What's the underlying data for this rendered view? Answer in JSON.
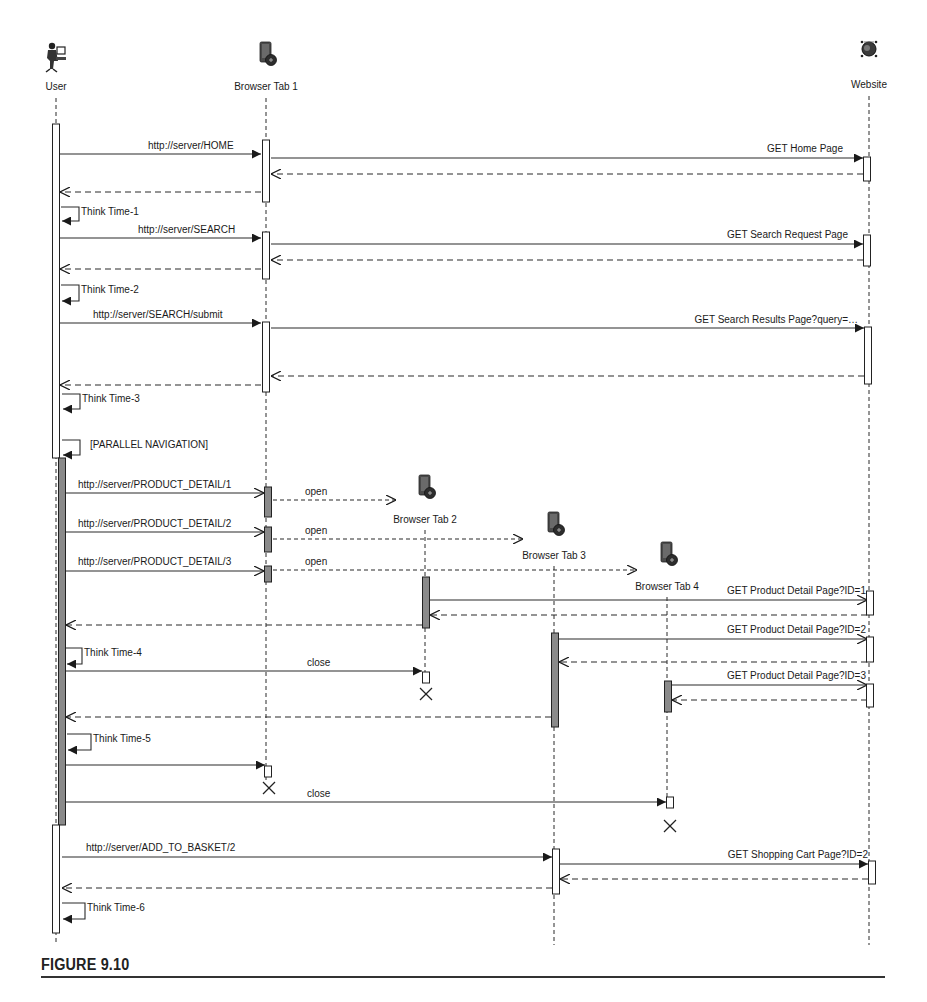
{
  "figure": {
    "caption": "FIGURE 9.10",
    "type": "UML sequence diagram"
  },
  "colors": {
    "line": "#2a2a2a",
    "activation_fill_light": "#ffffff",
    "activation_fill_dark": "#8a8a8a",
    "text": "#1a1a1a"
  },
  "lifelines": [
    {
      "id": "user",
      "label": "User",
      "icon": "user-at-computer-icon",
      "x": 56,
      "head_y": 55,
      "label_y": 90,
      "line_top": 98,
      "line_bottom": 945
    },
    {
      "id": "tab1",
      "label": "Browser Tab 1",
      "icon": "browser-tab-icon",
      "x": 266,
      "head_y": 55,
      "label_y": 90,
      "line_top": 98,
      "line_bottom": 780
    },
    {
      "id": "tab2",
      "label": "Browser Tab 2",
      "icon": "browser-tab-icon",
      "x": 425,
      "head_y": 488,
      "label_y": 523,
      "line_top": 530,
      "line_bottom": 672
    },
    {
      "id": "tab3",
      "label": "Browser Tab 3",
      "icon": "browser-tab-icon",
      "x": 554,
      "head_y": 525,
      "label_y": 559,
      "line_top": 566,
      "line_bottom": 945
    },
    {
      "id": "tab4",
      "label": "Browser Tab 4",
      "icon": "browser-tab-icon",
      "x": 667,
      "head_y": 555,
      "label_y": 590,
      "line_top": 597,
      "line_bottom": 804
    },
    {
      "id": "website",
      "label": "Website",
      "icon": "website-server-icon",
      "x": 869,
      "head_y": 55,
      "label_y": 88,
      "line_top": 96,
      "line_bottom": 945
    }
  ],
  "activations": [
    {
      "lifeline": "user",
      "x": 56,
      "y1": 124,
      "y2": 458,
      "style": "light"
    },
    {
      "lifeline": "user",
      "x": 62,
      "y1": 458,
      "y2": 825,
      "style": "dark"
    },
    {
      "lifeline": "user",
      "x": 56,
      "y1": 825,
      "y2": 933,
      "style": "light"
    },
    {
      "lifeline": "tab1",
      "x": 266,
      "y1": 140,
      "y2": 202,
      "style": "light"
    },
    {
      "lifeline": "tab1",
      "x": 266,
      "y1": 232,
      "y2": 279,
      "style": "light"
    },
    {
      "lifeline": "tab1",
      "x": 266,
      "y1": 322,
      "y2": 392,
      "style": "light"
    },
    {
      "lifeline": "tab1",
      "x": 268,
      "y1": 487,
      "y2": 517,
      "style": "dark"
    },
    {
      "lifeline": "tab1",
      "x": 268,
      "y1": 527,
      "y2": 552,
      "style": "dark"
    },
    {
      "lifeline": "tab1",
      "x": 268,
      "y1": 566,
      "y2": 582,
      "style": "dark"
    },
    {
      "lifeline": "tab1",
      "x": 268,
      "y1": 766,
      "y2": 777,
      "style": "light"
    },
    {
      "lifeline": "tab2",
      "x": 426,
      "y1": 577,
      "y2": 628,
      "style": "dark"
    },
    {
      "lifeline": "tab2",
      "x": 426,
      "y1": 672,
      "y2": 683,
      "style": "light"
    },
    {
      "lifeline": "tab3",
      "x": 555,
      "y1": 633,
      "y2": 727,
      "style": "dark"
    },
    {
      "lifeline": "tab3",
      "x": 556,
      "y1": 849,
      "y2": 894,
      "style": "light"
    },
    {
      "lifeline": "tab4",
      "x": 668,
      "y1": 681,
      "y2": 712,
      "style": "dark"
    },
    {
      "lifeline": "tab4",
      "x": 670,
      "y1": 797,
      "y2": 808,
      "style": "light"
    },
    {
      "lifeline": "website",
      "x": 867,
      "y1": 157,
      "y2": 181,
      "style": "light"
    },
    {
      "lifeline": "website",
      "x": 867,
      "y1": 235,
      "y2": 266,
      "style": "light"
    },
    {
      "lifeline": "website",
      "x": 868,
      "y1": 327,
      "y2": 384,
      "style": "light"
    },
    {
      "lifeline": "website",
      "x": 870,
      "y1": 591,
      "y2": 615,
      "style": "light"
    },
    {
      "lifeline": "website",
      "x": 870,
      "y1": 637,
      "y2": 662,
      "style": "light"
    },
    {
      "lifeline": "website",
      "x": 870,
      "y1": 684,
      "y2": 707,
      "style": "light"
    },
    {
      "lifeline": "website",
      "x": 872,
      "y1": 861,
      "y2": 884,
      "style": "light"
    }
  ],
  "messages": [
    {
      "label": "http://server/HOME",
      "from_x": 60,
      "to_x": 261,
      "y": 154,
      "kind": "sync",
      "label_x": 148,
      "label_y": 149,
      "anchor": "start"
    },
    {
      "label": "GET Home Page",
      "from_x": 271,
      "to_x": 863,
      "y": 158,
      "kind": "sync",
      "label_x": 843,
      "label_y": 152,
      "anchor": "end"
    },
    {
      "label": "",
      "from_x": 863,
      "to_x": 271,
      "y": 174,
      "kind": "reply"
    },
    {
      "label": "",
      "from_x": 261,
      "to_x": 60,
      "y": 192,
      "kind": "reply"
    },
    {
      "label": "http://server/SEARCH",
      "from_x": 60,
      "to_x": 261,
      "y": 238,
      "kind": "sync",
      "label_x": 138,
      "label_y": 233,
      "anchor": "start"
    },
    {
      "label": "GET Search Request Page",
      "from_x": 271,
      "to_x": 863,
      "y": 244,
      "kind": "sync",
      "label_x": 848,
      "label_y": 238,
      "anchor": "end"
    },
    {
      "label": "",
      "from_x": 863,
      "to_x": 271,
      "y": 260,
      "kind": "reply"
    },
    {
      "label": "",
      "from_x": 261,
      "to_x": 60,
      "y": 269,
      "kind": "reply"
    },
    {
      "label": "http://server/SEARCH/submit",
      "from_x": 60,
      "to_x": 261,
      "y": 323,
      "kind": "sync",
      "label_x": 93,
      "label_y": 318,
      "anchor": "start"
    },
    {
      "label": "GET Search Results Page?query=…",
      "from_x": 271,
      "to_x": 864,
      "y": 328,
      "kind": "sync",
      "label_x": 858,
      "label_y": 323,
      "anchor": "end"
    },
    {
      "label": "",
      "from_x": 864,
      "to_x": 271,
      "y": 376,
      "kind": "reply"
    },
    {
      "label": "",
      "from_x": 261,
      "to_x": 60,
      "y": 385,
      "kind": "reply"
    },
    {
      "label": "http://server/PRODUCT_DETAIL/1",
      "from_x": 66,
      "to_x": 264,
      "y": 493,
      "kind": "async",
      "label_x": 78,
      "label_y": 488,
      "anchor": "start"
    },
    {
      "label": "open",
      "from_x": 273,
      "to_x": 396,
      "y": 500,
      "kind": "create",
      "label_x": 305,
      "label_y": 495,
      "anchor": "start"
    },
    {
      "label": "http://server/PRODUCT_DETAIL/2",
      "from_x": 66,
      "to_x": 264,
      "y": 532,
      "kind": "async",
      "label_x": 78,
      "label_y": 527,
      "anchor": "start"
    },
    {
      "label": "open",
      "from_x": 273,
      "to_x": 523,
      "y": 539,
      "kind": "create",
      "label_x": 305,
      "label_y": 534,
      "anchor": "start"
    },
    {
      "label": "http://server/PRODUCT_DETAIL/3",
      "from_x": 66,
      "to_x": 264,
      "y": 571,
      "kind": "async",
      "label_x": 78,
      "label_y": 565,
      "anchor": "start"
    },
    {
      "label": "open",
      "from_x": 273,
      "to_x": 637,
      "y": 570,
      "kind": "create",
      "label_x": 305,
      "label_y": 565,
      "anchor": "start"
    },
    {
      "label": "GET Product Detail Page?ID=1",
      "from_x": 430,
      "to_x": 867,
      "y": 600,
      "kind": "async",
      "label_x": 866,
      "label_y": 594,
      "anchor": "end"
    },
    {
      "label": "",
      "from_x": 867,
      "to_x": 430,
      "y": 615,
      "kind": "reply"
    },
    {
      "label": "",
      "from_x": 422,
      "to_x": 66,
      "y": 625,
      "kind": "reply"
    },
    {
      "label": "GET Product Detail Page?ID=2",
      "from_x": 559,
      "to_x": 867,
      "y": 639,
      "kind": "async",
      "label_x": 866,
      "label_y": 633,
      "anchor": "end"
    },
    {
      "label": "",
      "from_x": 867,
      "to_x": 559,
      "y": 662,
      "kind": "reply"
    },
    {
      "label": "close",
      "from_x": 66,
      "to_x": 422,
      "y": 671,
      "kind": "sync",
      "label_x": 307,
      "label_y": 666,
      "anchor": "start"
    },
    {
      "label": "GET Product Detail Page?ID=3",
      "from_x": 672,
      "to_x": 867,
      "y": 685,
      "kind": "async",
      "label_x": 866,
      "label_y": 679,
      "anchor": "end"
    },
    {
      "label": "",
      "from_x": 867,
      "to_x": 672,
      "y": 700,
      "kind": "reply"
    },
    {
      "label": "",
      "from_x": 551,
      "to_x": 66,
      "y": 717,
      "kind": "reply"
    },
    {
      "label": "",
      "from_x": 66,
      "to_x": 265,
      "y": 765,
      "kind": "sync"
    },
    {
      "label": "close",
      "from_x": 66,
      "to_x": 666,
      "y": 802,
      "kind": "sync",
      "label_x": 307,
      "label_y": 797,
      "anchor": "start"
    },
    {
      "label": "http://server/ADD_TO_BASKET/2",
      "from_x": 62,
      "to_x": 552,
      "y": 857,
      "kind": "sync",
      "label_x": 86,
      "label_y": 851,
      "anchor": "start"
    },
    {
      "label": "GET Shopping Cart Page?ID=2",
      "from_x": 560,
      "to_x": 868,
      "y": 864,
      "kind": "sync",
      "label_x": 868,
      "label_y": 858,
      "anchor": "end"
    },
    {
      "label": "",
      "from_x": 868,
      "to_x": 560,
      "y": 879,
      "kind": "reply"
    },
    {
      "label": "",
      "from_x": 552,
      "to_x": 62,
      "y": 888,
      "kind": "reply"
    }
  ],
  "self_messages": [
    {
      "label": "Think Time-1",
      "x": 61,
      "y": 207,
      "w": 18,
      "h": 14
    },
    {
      "label": "Think Time-2",
      "x": 61,
      "y": 285,
      "w": 18,
      "h": 16
    },
    {
      "label": "Think Time-3",
      "x": 62,
      "y": 394,
      "w": 18,
      "h": 15
    },
    {
      "label": "[PARALLEL NAVIGATION]",
      "x": 62,
      "y": 440,
      "w": 18,
      "h": 15,
      "label_dx": 8
    },
    {
      "label": "Think Time-4",
      "x": 66,
      "y": 648,
      "w": 16,
      "h": 16
    },
    {
      "label": "Think Time-5",
      "x": 67,
      "y": 734,
      "w": 24,
      "h": 16
    },
    {
      "label": "Think Time-6",
      "x": 62,
      "y": 903,
      "w": 23,
      "h": 16
    }
  ],
  "destructions": [
    {
      "lifeline": "tab2",
      "x": 426,
      "y": 694
    },
    {
      "lifeline": "tab1",
      "x": 269,
      "y": 788
    },
    {
      "lifeline": "tab4",
      "x": 670,
      "y": 826
    }
  ]
}
